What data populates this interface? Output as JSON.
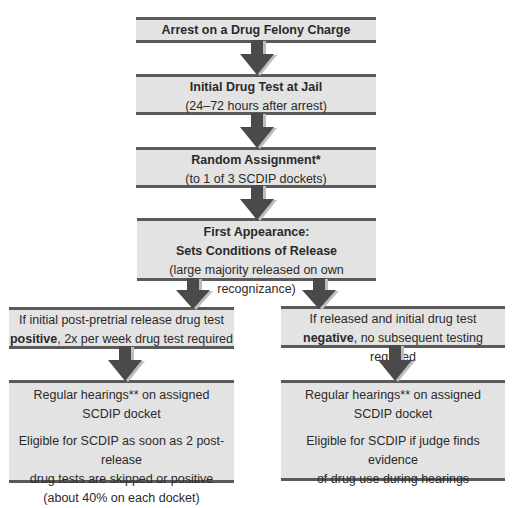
{
  "colors": {
    "box_fill": "#e3e3e3",
    "box_rule": "#5a5a5a",
    "arrow": "#4a4a4a",
    "arrow_shadow": "#bdbdbd"
  },
  "nodes": {
    "arrest": {
      "title": "Arrest on a Drug Felony Charge"
    },
    "initial_test": {
      "title": "Initial Drug Test at Jail",
      "subtitle": "(24–72 hours after arrest)"
    },
    "random_assignment": {
      "title": "Random Assignment*",
      "subtitle": "(to 1 of 3 SCDIP dockets)"
    },
    "first_appearance": {
      "title_line1": "First Appearance:",
      "title_line2": "Sets Conditions of Release",
      "subtitle": "(large majority released on own recognizance)"
    },
    "positive_branch": {
      "line1": "If initial post-pretrial release drug test",
      "bold": "positive",
      "line2_rest": ", 2x per week drug test required"
    },
    "negative_branch": {
      "line1": "If released and initial drug test",
      "bold": "negative",
      "line2_rest": ", no subsequent testing required"
    },
    "positive_outcome": {
      "line1": "Regular hearings** on assigned",
      "line2": "SCDIP docket",
      "line3": "Eligible for SCDIP as soon as 2 post-release",
      "line4": "drug tests are skipped or positive",
      "line5": "(about 40% on each docket)"
    },
    "negative_outcome": {
      "line1": "Regular hearings** on assigned",
      "line2": "SCDIP docket",
      "line3": "Eligible for SCDIP if judge finds evidence",
      "line4": "of drug use during hearings"
    }
  },
  "edges": [
    {
      "from": "arrest",
      "to": "initial_test"
    },
    {
      "from": "initial_test",
      "to": "random_assignment"
    },
    {
      "from": "random_assignment",
      "to": "first_appearance"
    },
    {
      "from": "first_appearance",
      "to": "positive_branch"
    },
    {
      "from": "first_appearance",
      "to": "negative_branch"
    },
    {
      "from": "positive_branch",
      "to": "positive_outcome"
    },
    {
      "from": "negative_branch",
      "to": "negative_outcome"
    }
  ]
}
